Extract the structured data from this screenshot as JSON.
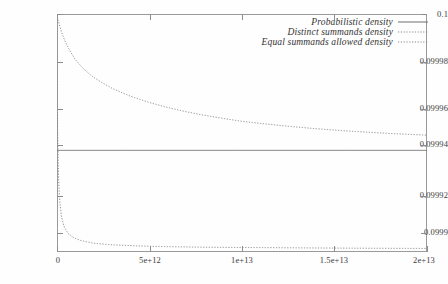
{
  "chart_data": {
    "type": "line",
    "title": "",
    "xlabel": "",
    "ylabel": "",
    "xlim": [
      0,
      20000000000000
    ],
    "ylim": [
      0.0999,
      0.1
    ],
    "grid": false,
    "legend_position": "top-right",
    "xticks": [
      {
        "value": 0,
        "label": "0"
      },
      {
        "value": 5000000000000,
        "label": "5e+12"
      },
      {
        "value": 10000000000000,
        "label": "1e+13"
      },
      {
        "value": 15000000000000,
        "label": "1.5e+13"
      },
      {
        "value": 20000000000000,
        "label": "2e+13"
      }
    ],
    "yticks": [
      {
        "value": 0.1,
        "label": "0.1"
      },
      {
        "value": 0.09998,
        "label": "0.09998"
      },
      {
        "value": 0.09996,
        "label": "0.09996"
      },
      {
        "value": 0.09994,
        "label": "0.09994"
      },
      {
        "value": 0.09992,
        "label": "0.09992"
      },
      {
        "value": 0.0999,
        "label": "0.0999"
      }
    ],
    "series": [
      {
        "name": "Probabilistic density",
        "style": "solid",
        "color": "#6e6e6e",
        "x": [
          0,
          2000000000000,
          5000000000000,
          10000000000000,
          15000000000000,
          20000000000000
        ],
        "values": [
          0.0999427,
          0.0999427,
          0.0999427,
          0.0999427,
          0.0999427,
          0.0999427
        ]
      },
      {
        "name": "Distinct summands density",
        "style": "dotted",
        "color": "#8a8a8a",
        "x": [
          0,
          100000000000,
          250000000000,
          500000000000,
          1000000000000,
          1500000000000,
          2000000000000,
          3000000000000,
          4000000000000,
          5000000000000,
          6000000000000,
          7000000000000,
          8000000000000,
          10000000000000.0,
          12000000000000.0,
          14000000000000.0,
          16000000000000.0,
          18000000000000.0,
          20000000000000.0
        ],
        "values": [
          0.1,
          0.0999965,
          0.0999924,
          0.0999875,
          0.0999808,
          0.0999765,
          0.0999733,
          0.0999687,
          0.0999654,
          0.0999628,
          0.0999607,
          0.0999589,
          0.0999574,
          0.0999549,
          0.0999532,
          0.0999518,
          0.0999507,
          0.0999498,
          0.0999491
        ]
      },
      {
        "name": "Equal summands allowed density",
        "style": "dotted",
        "color": "#8a8a8a",
        "x": [
          0,
          50000000000,
          120000000000,
          250000000000,
          400000000000,
          600000000000,
          900000000000,
          1300000000000,
          2000000000000,
          3000000000000,
          5000000000000,
          8000000000000,
          12000000000000.0,
          16000000000000.0,
          20000000000000.0
        ],
        "values": [
          0.1,
          0.0999406,
          0.0999243,
          0.0999144,
          0.0999104,
          0.0999078,
          0.099906,
          0.0999048,
          0.0999037,
          0.099903,
          0.0999024,
          0.099902,
          0.0999018,
          0.0999016,
          0.0999015
        ]
      }
    ]
  },
  "legend": {
    "entries": [
      {
        "label": "Probabilistic density",
        "style": "solid"
      },
      {
        "label": "Distinct summands density",
        "style": "dotted"
      },
      {
        "label": "Equal summands allowed density",
        "style": "dotted"
      }
    ]
  },
  "axes": {
    "y_labels": [
      "0.1",
      "0.09998",
      "0.09996",
      "0.09994",
      "0.09992",
      "0.0999"
    ],
    "x_labels": [
      "0",
      "5e+12",
      "1e+13",
      "1.5e+13",
      "2e+13"
    ]
  }
}
